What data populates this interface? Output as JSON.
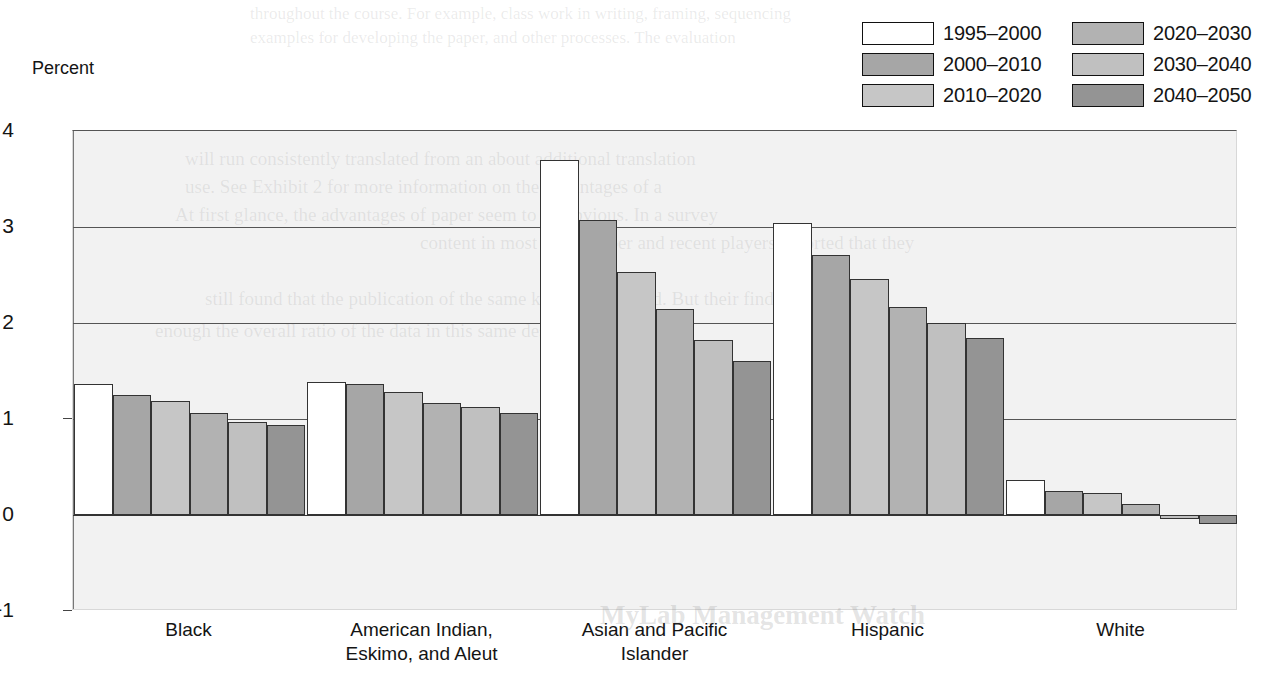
{
  "axis": {
    "y_title": "Percent",
    "yticks": [
      "4",
      "3",
      "2",
      "1",
      "0",
      "−1"
    ]
  },
  "legend": {
    "items": [
      {
        "label": "1995–2000",
        "color": "#ffffff"
      },
      {
        "label": "2000–2010",
        "color": "#a6a6a6"
      },
      {
        "label": "2010–2020",
        "color": "#c6c6c6"
      },
      {
        "label": "2020–2030",
        "color": "#b2b2b2"
      },
      {
        "label": "2030–2040",
        "color": "#c0c0c0"
      },
      {
        "label": "2040–2050",
        "color": "#949494"
      }
    ]
  },
  "chart_data": {
    "type": "bar",
    "title": "",
    "xlabel": "",
    "ylabel": "Percent",
    "ylim": [
      -1,
      4
    ],
    "yticks": [
      -1,
      0,
      1,
      2,
      3,
      4
    ],
    "grid": true,
    "legend_position": "top-right",
    "categories": [
      "Black",
      "American Indian,\nEskimo, and Aleut",
      "Asian and Pacific\nIslander",
      "Hispanic",
      "White"
    ],
    "series": [
      {
        "name": "1995–2000",
        "color": "#ffffff",
        "values": [
          1.36,
          1.39,
          3.7,
          3.04,
          0.36
        ]
      },
      {
        "name": "2000–2010",
        "color": "#a6a6a6",
        "values": [
          1.25,
          1.36,
          3.07,
          2.71,
          0.25
        ]
      },
      {
        "name": "2010–2020",
        "color": "#c6c6c6",
        "values": [
          1.19,
          1.28,
          2.53,
          2.46,
          0.23
        ]
      },
      {
        "name": "2020–2030",
        "color": "#b2b2b2",
        "values": [
          1.06,
          1.17,
          2.15,
          2.17,
          0.11
        ]
      },
      {
        "name": "2030–2040",
        "color": "#c0c0c0",
        "values": [
          0.97,
          1.13,
          1.82,
          2.0,
          -0.04
        ]
      },
      {
        "name": "2040–2050",
        "color": "#949494",
        "values": [
          0.94,
          1.06,
          1.6,
          1.84,
          -0.09
        ]
      }
    ]
  },
  "bleed_text": [
    "throughout the course. For example, class work in writing, framing, sequencing",
    "examples for developing the paper, and other processes. The evaluation",
    "will run consistently translated from an about additional translation",
    "use. See Exhibit 2 for more information on the advantages of a",
    "At first glance, the advantages of paper seem to an obvious.  In a survey",
    "content in most of the paper and recent players reported that they",
    "still found that the publication of the same kind of ingrained.   But their findings",
    "enough the overall ratio of the data in this same design of the content.",
    "MyLab Management Watch"
  ]
}
